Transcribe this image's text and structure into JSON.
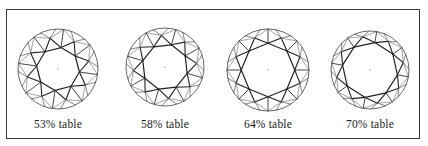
{
  "figure": {
    "border_color": "#3a3a3a",
    "line_color": "#222222",
    "girdle_color": "#555555",
    "diamonds": [
      {
        "label": "53% table",
        "table_percent": 53,
        "cx": 58,
        "cy": 69,
        "r": 40,
        "rotation": 8
      },
      {
        "label": "58% table",
        "table_percent": 58,
        "cx": 165,
        "cy": 67,
        "r": 39,
        "rotation": 16
      },
      {
        "label": "64% table",
        "table_percent": 64,
        "cx": 268,
        "cy": 70,
        "r": 41,
        "rotation": 0
      },
      {
        "label": "70% table",
        "table_percent": 70,
        "cx": 370,
        "cy": 70,
        "r": 39,
        "rotation": 10
      }
    ]
  }
}
